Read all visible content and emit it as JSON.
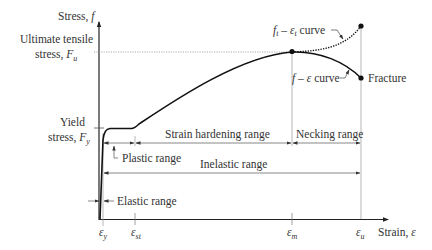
{
  "diagram": {
    "type": "stress-strain curve",
    "axes": {
      "y_label": "Stress, ",
      "y_symbol": "f",
      "x_label": "Strain, ",
      "x_symbol": "ε"
    },
    "stress_levels": {
      "ultimate_line1": "Ultimate tensile",
      "ultimate_line2": "stress, ",
      "ultimate_symbol": "F",
      "ultimate_sub": "u",
      "yield_line1": "Yield",
      "yield_line2": "stress, ",
      "yield_symbol": "F",
      "yield_sub": "y"
    },
    "strain_ticks": [
      {
        "symbol": "ε",
        "sub": "y"
      },
      {
        "symbol": "ε",
        "sub": "st"
      },
      {
        "symbol": "ε",
        "sub": "m"
      },
      {
        "symbol": "ε",
        "sub": "u"
      }
    ],
    "curves": {
      "true_curve_label_f": "f",
      "true_curve_sub_t": "t",
      "true_curve_dash": " – ",
      "true_curve_eps": "ε",
      "true_curve_word": " curve",
      "eng_curve_f": "f",
      "eng_curve_dash": " – ",
      "eng_curve_eps": "ε",
      "eng_curve_word": " curve",
      "fracture": "Fracture"
    },
    "ranges": {
      "strain_hardening": "Strain hardening range",
      "necking": "Necking range",
      "plastic": "Plastic range",
      "inelastic": "Inelastic range",
      "elastic": "Elastic range"
    },
    "colors": {
      "curve": "#111111",
      "guide": "#888888",
      "text": "#333333"
    }
  }
}
